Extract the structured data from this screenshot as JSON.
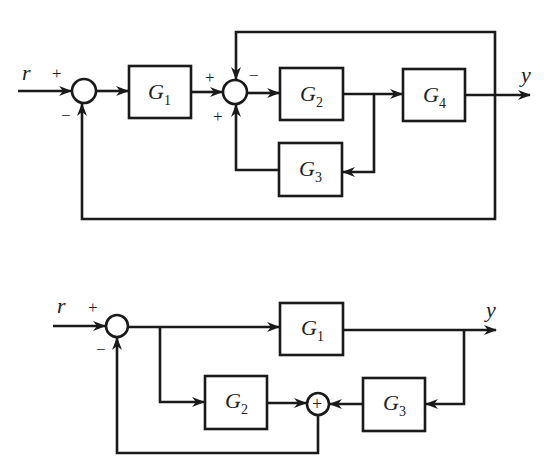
{
  "diagram_1": {
    "input_label": "r",
    "output_label": "y",
    "sum1": {
      "plus": "+",
      "minus": "−"
    },
    "sum2": {
      "plus_left": "+",
      "minus_top": "−",
      "plus_bottom": "+"
    },
    "blocks": [
      {
        "name": "G",
        "sub": "1"
      },
      {
        "name": "G",
        "sub": "2"
      },
      {
        "name": "G",
        "sub": "3"
      },
      {
        "name": "G",
        "sub": "4"
      }
    ]
  },
  "diagram_2": {
    "input_label": "r",
    "output_label": "y",
    "sum1": {
      "plus": "+",
      "minus": "−"
    },
    "sum2_symbol": "+",
    "blocks": [
      {
        "name": "G",
        "sub": "1"
      },
      {
        "name": "G",
        "sub": "2"
      },
      {
        "name": "G",
        "sub": "3"
      }
    ]
  },
  "colors": {
    "stroke": "#1a1a1a",
    "background": "#ffffff"
  }
}
